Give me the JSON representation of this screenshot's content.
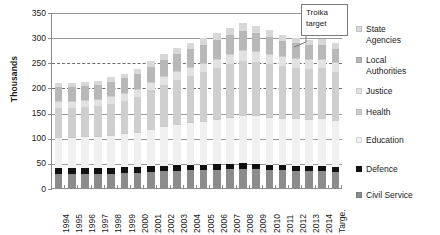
{
  "chart_data": {
    "type": "bar",
    "subtype": "stacked-column",
    "title": "",
    "xlabel": "",
    "ylabel": "Thousands",
    "ylim": [
      0,
      350
    ],
    "ytick_step": 50,
    "yticks": [
      0,
      50,
      100,
      150,
      200,
      250,
      300,
      350
    ],
    "ytick_labels": [
      "0",
      "50",
      "100",
      "150",
      "200",
      "250",
      "300",
      "350"
    ],
    "grid": true,
    "legend_position": "right",
    "categories": [
      "1994",
      "1995",
      "1996",
      "1997",
      "1998",
      "1999",
      "2000",
      "2001",
      "2002",
      "2003",
      "2004",
      "2005",
      "2006",
      "2007",
      "2008",
      "2009",
      "2010",
      "2011",
      "2012",
      "2013",
      "2014",
      "Targe."
    ],
    "series": [
      {
        "name": "Civil Service",
        "color": "#8c8c8c",
        "values": [
          29,
          29,
          29,
          29,
          30,
          31,
          32,
          34,
          35,
          36,
          37,
          37,
          38,
          39,
          40,
          39,
          38,
          37,
          36,
          35,
          35,
          34
        ]
      },
      {
        "name": "Defence",
        "color": "#111111",
        "values": [
          13,
          13,
          13,
          12,
          12,
          12,
          11,
          11,
          11,
          11,
          11,
          11,
          11,
          11,
          11,
          11,
          10,
          10,
          10,
          10,
          10,
          10
        ]
      },
      {
        "name": "Education",
        "color": "#f0f0f0",
        "values": [
          61,
          62,
          63,
          64,
          66,
          68,
          71,
          75,
          79,
          82,
          85,
          88,
          91,
          94,
          97,
          97,
          96,
          95,
          95,
          95,
          96,
          93
        ]
      },
      {
        "name": "Health",
        "color": "#cfcfcf",
        "values": [
          58,
          58,
          59,
          60,
          62,
          65,
          69,
          76,
          82,
          88,
          92,
          96,
          100,
          104,
          107,
          106,
          104,
          102,
          100,
          99,
          99,
          96
        ]
      },
      {
        "name": "Justice",
        "color": "#e2e2e2",
        "values": [
          14,
          14,
          14,
          14,
          15,
          15,
          16,
          16,
          17,
          17,
          18,
          18,
          19,
          20,
          21,
          21,
          21,
          20,
          20,
          19,
          19,
          19
        ]
      },
      {
        "name": "Local Authorities",
        "color": "#b8b8b8",
        "values": [
          27,
          27,
          27,
          28,
          28,
          29,
          30,
          31,
          33,
          34,
          35,
          36,
          37,
          38,
          39,
          37,
          34,
          31,
          29,
          28,
          28,
          27
        ]
      },
      {
        "name": "State Agencies",
        "color": "#d8d8d8",
        "values": [
          8,
          8,
          8,
          8,
          9,
          9,
          10,
          11,
          12,
          13,
          13,
          14,
          14,
          15,
          15,
          14,
          13,
          12,
          11,
          11,
          11,
          11
        ]
      }
    ],
    "totals": [
      210,
      211,
      213,
      215,
      222,
      229,
      239,
      254,
      269,
      281,
      291,
      300,
      310,
      321,
      330,
      325,
      316,
      307,
      301,
      297,
      298,
      290
    ],
    "annotations": [
      {
        "name": "troika-target",
        "text": "Troika\ntarget",
        "line1": "Troika",
        "line2": "target"
      }
    ]
  },
  "legend": {
    "items": [
      {
        "label": "State\nAgencies",
        "color": "#d8d8d8"
      },
      {
        "label": "Local\nAuthorities",
        "color": "#b8b8b8"
      },
      {
        "label": "Justice",
        "color": "#e2e2e2"
      },
      {
        "label": "Health",
        "color": "#cfcfcf"
      },
      {
        "label": "Education",
        "color": "#f0f0f0"
      },
      {
        "label": "Defence",
        "color": "#111111"
      },
      {
        "label": "Civil Service",
        "color": "#8c8c8c"
      }
    ]
  }
}
